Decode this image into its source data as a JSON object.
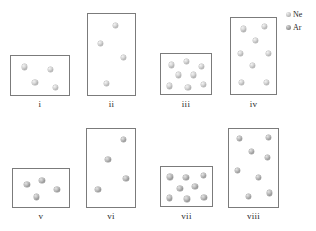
{
  "figure": {
    "type": "particle-diagram"
  },
  "legend": {
    "position": "top-right",
    "entries": [
      {
        "label": "Ne",
        "marker": "sphere-icon",
        "shade": "light",
        "color": "#c9c9c9"
      },
      {
        "label": "Ar",
        "marker": "sphere-icon",
        "shade": "dark",
        "color": "#a8a8a8"
      }
    ]
  },
  "boxes": [
    {
      "id": "i",
      "label": "i",
      "gas": "Ne",
      "count": 4,
      "rect": {
        "x": 10,
        "y": 55,
        "w": 60,
        "h": 41
      },
      "label_pos": {
        "x": 10,
        "y": 99,
        "w": 60
      },
      "particles": [
        {
          "x": 0.22,
          "y": 0.27
        },
        {
          "x": 0.66,
          "y": 0.33
        },
        {
          "x": 0.4,
          "y": 0.64
        },
        {
          "x": 0.74,
          "y": 0.76
        }
      ]
    },
    {
      "id": "ii",
      "label": "ii",
      "gas": "Ne",
      "count": 4,
      "rect": {
        "x": 87,
        "y": 13,
        "w": 49,
        "h": 83
      },
      "label_pos": {
        "x": 87,
        "y": 99,
        "w": 49
      },
      "particles": [
        {
          "x": 0.56,
          "y": 0.14
        },
        {
          "x": 0.25,
          "y": 0.36
        },
        {
          "x": 0.73,
          "y": 0.52
        },
        {
          "x": 0.38,
          "y": 0.84
        }
      ]
    },
    {
      "id": "iii",
      "label": "iii",
      "gas": "Ne",
      "count": 8,
      "rect": {
        "x": 160,
        "y": 53,
        "w": 52,
        "h": 42
      },
      "label_pos": {
        "x": 160,
        "y": 99,
        "w": 52
      },
      "particles": [
        {
          "x": 0.2,
          "y": 0.26
        },
        {
          "x": 0.49,
          "y": 0.18
        },
        {
          "x": 0.78,
          "y": 0.29
        },
        {
          "x": 0.33,
          "y": 0.5
        },
        {
          "x": 0.62,
          "y": 0.5
        },
        {
          "x": 0.17,
          "y": 0.76
        },
        {
          "x": 0.52,
          "y": 0.79
        },
        {
          "x": 0.82,
          "y": 0.72
        }
      ]
    },
    {
      "id": "iv",
      "label": "iv",
      "gas": "Ne",
      "count": 8,
      "rect": {
        "x": 230,
        "y": 17,
        "w": 47,
        "h": 78
      },
      "label_pos": {
        "x": 230,
        "y": 99,
        "w": 47
      },
      "particles": [
        {
          "x": 0.26,
          "y": 0.14
        },
        {
          "x": 0.71,
          "y": 0.11
        },
        {
          "x": 0.53,
          "y": 0.29
        },
        {
          "x": 0.2,
          "y": 0.45
        },
        {
          "x": 0.79,
          "y": 0.45
        },
        {
          "x": 0.46,
          "y": 0.61
        },
        {
          "x": 0.22,
          "y": 0.83
        },
        {
          "x": 0.76,
          "y": 0.83
        }
      ]
    },
    {
      "id": "v",
      "label": "v",
      "gas": "Ar",
      "count": 4,
      "rect": {
        "x": 12,
        "y": 168,
        "w": 58,
        "h": 40
      },
      "label_pos": {
        "x": 12,
        "y": 211,
        "w": 58
      },
      "particles": [
        {
          "x": 0.24,
          "y": 0.38
        },
        {
          "x": 0.5,
          "y": 0.28
        },
        {
          "x": 0.76,
          "y": 0.52
        },
        {
          "x": 0.41,
          "y": 0.7
        }
      ]
    },
    {
      "id": "vi",
      "label": "vi",
      "gas": "Ar",
      "count": 4,
      "rect": {
        "x": 86,
        "y": 128,
        "w": 50,
        "h": 80
      },
      "label_pos": {
        "x": 86,
        "y": 211,
        "w": 50
      },
      "particles": [
        {
          "x": 0.73,
          "y": 0.13
        },
        {
          "x": 0.42,
          "y": 0.38
        },
        {
          "x": 0.78,
          "y": 0.62
        },
        {
          "x": 0.22,
          "y": 0.76
        }
      ]
    },
    {
      "id": "vii",
      "label": "vii",
      "gas": "Ar",
      "count": 8,
      "rect": {
        "x": 160,
        "y": 166,
        "w": 53,
        "h": 41
      },
      "label_pos": {
        "x": 160,
        "y": 211,
        "w": 53
      },
      "particles": [
        {
          "x": 0.17,
          "y": 0.24
        },
        {
          "x": 0.47,
          "y": 0.26
        },
        {
          "x": 0.8,
          "y": 0.2
        },
        {
          "x": 0.36,
          "y": 0.52
        },
        {
          "x": 0.64,
          "y": 0.48
        },
        {
          "x": 0.16,
          "y": 0.76
        },
        {
          "x": 0.49,
          "y": 0.78
        },
        {
          "x": 0.81,
          "y": 0.74
        }
      ]
    },
    {
      "id": "viii",
      "label": "viii",
      "gas": "Ar",
      "count": 8,
      "rect": {
        "x": 228,
        "y": 128,
        "w": 51,
        "h": 80
      },
      "label_pos": {
        "x": 228,
        "y": 211,
        "w": 51
      },
      "particles": [
        {
          "x": 0.2,
          "y": 0.12
        },
        {
          "x": 0.78,
          "y": 0.11
        },
        {
          "x": 0.44,
          "y": 0.28
        },
        {
          "x": 0.76,
          "y": 0.36
        },
        {
          "x": 0.17,
          "y": 0.52
        },
        {
          "x": 0.58,
          "y": 0.61
        },
        {
          "x": 0.38,
          "y": 0.84
        },
        {
          "x": 0.8,
          "y": 0.8
        }
      ]
    }
  ]
}
